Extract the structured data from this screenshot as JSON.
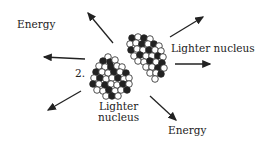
{
  "labels": {
    "energy_top": "Energy",
    "lighter_right": "Lighter nucleus",
    "step_number": "2.",
    "lighter_bottom_line1": "Lighter",
    "lighter_bottom_line2": "nucleus",
    "energy_bottom": "Energy"
  },
  "colors": {
    "ink": "#222222",
    "background": "#ffffff"
  }
}
